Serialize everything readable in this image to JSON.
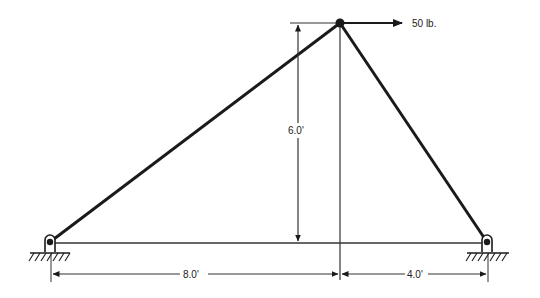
{
  "diagram": {
    "type": "truss",
    "load": {
      "label": "50 lb.",
      "direction": "right",
      "at": "apex"
    },
    "dimensions": {
      "height": "6.0'",
      "left_span": "8.0'",
      "right_span": "4.0'"
    },
    "supports": [
      {
        "name": "left-pin-support",
        "type": "pin"
      },
      {
        "name": "right-pin-support",
        "type": "pin"
      }
    ],
    "colors": {
      "line": "#1a1a1a",
      "background": "#ffffff"
    }
  }
}
